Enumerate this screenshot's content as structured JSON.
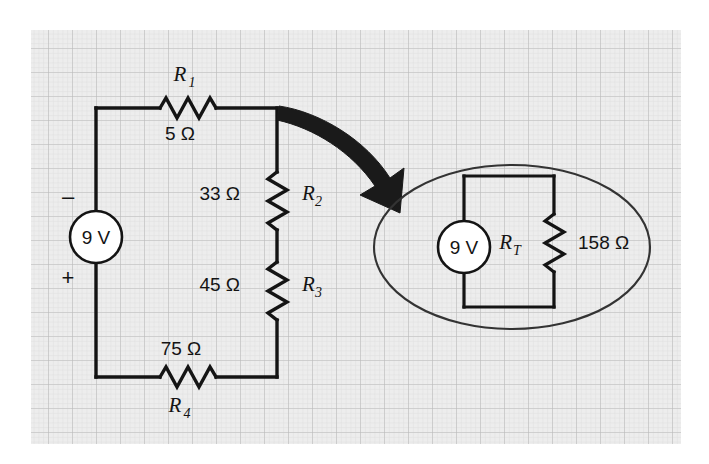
{
  "figure": {
    "background_color": "#ffffff",
    "grid_color": "#c9c9c9",
    "grid_fill": "#e9e9e9",
    "line_color": "#141414",
    "arrow_color": "#1a1a1a"
  },
  "source_circuit": {
    "supply": {
      "value": "9 V",
      "minus_sign": "–",
      "plus_sign": "+"
    },
    "resistors": [
      {
        "id": "R1",
        "name_base": "R",
        "name_sub": "1",
        "value": "5 Ω",
        "orientation": "horizontal",
        "position": "top"
      },
      {
        "id": "R2",
        "name_base": "R",
        "name_sub": "2",
        "value": "33 Ω",
        "orientation": "vertical",
        "position": "right-upper"
      },
      {
        "id": "R3",
        "name_base": "R",
        "name_sub": "3",
        "value": "45 Ω",
        "orientation": "vertical",
        "position": "right-lower"
      },
      {
        "id": "R4",
        "name_base": "R",
        "name_sub": "4",
        "value": "75 Ω",
        "orientation": "horizontal",
        "position": "bottom"
      }
    ]
  },
  "equivalent_circuit": {
    "supply": {
      "value": "9 V"
    },
    "resistor": {
      "id": "RT",
      "name_base": "R",
      "name_sub": "T",
      "value": "158 Ω",
      "orientation": "vertical"
    },
    "callout_shape": "ellipse"
  },
  "annotation": {
    "arrow": "curved-arrow-right-down"
  }
}
